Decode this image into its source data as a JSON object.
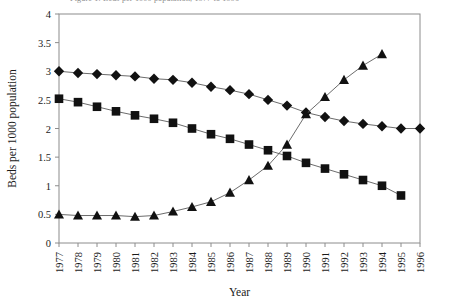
{
  "figure": {
    "truncated_caption": "Figure 1. Beds per 1000 population, 1977 to 1996",
    "xlabel": "Year",
    "ylabel": "Beds per 1000 population"
  },
  "chart_data": {
    "type": "line",
    "title": "",
    "xlabel": "Year",
    "ylabel": "Beds per 1000 population",
    "xlim": [
      1977,
      1996
    ],
    "ylim": [
      0,
      4
    ],
    "ytick_step": 0.5,
    "grid": false,
    "legend": "none",
    "x": [
      1977,
      1978,
      1979,
      1980,
      1981,
      1982,
      1983,
      1984,
      1985,
      1986,
      1987,
      1988,
      1989,
      1990,
      1991,
      1992,
      1993,
      1994,
      1995,
      1996
    ],
    "yticks": [
      0,
      0.5,
      1,
      1.5,
      2,
      2.5,
      3,
      3.5,
      4
    ],
    "xticks": [
      "1977",
      "1978",
      "1979",
      "1980",
      "1981",
      "1982",
      "1983",
      "1984",
      "1985",
      "1986",
      "1987",
      "1988",
      "1989",
      "1990",
      "1991",
      "1992",
      "1993",
      "1994",
      "1995",
      "1996"
    ],
    "series": [
      {
        "name": "Series 1",
        "marker": "diamond",
        "color": "#111111",
        "x": [
          1977,
          1978,
          1979,
          1980,
          1981,
          1982,
          1983,
          1984,
          1985,
          1986,
          1987,
          1988,
          1989,
          1990,
          1991,
          1992,
          1993,
          1994,
          1995,
          1996
        ],
        "values": [
          3.0,
          2.97,
          2.95,
          2.93,
          2.91,
          2.87,
          2.85,
          2.8,
          2.73,
          2.67,
          2.6,
          2.5,
          2.4,
          2.28,
          2.2,
          2.13,
          2.08,
          2.04,
          2.0,
          2.0
        ]
      },
      {
        "name": "Series 2",
        "marker": "square",
        "color": "#111111",
        "x": [
          1977,
          1978,
          1979,
          1980,
          1981,
          1982,
          1983,
          1984,
          1985,
          1986,
          1987,
          1988,
          1989,
          1990,
          1991,
          1992,
          1993,
          1994,
          1995
        ],
        "values": [
          2.52,
          2.46,
          2.38,
          2.3,
          2.23,
          2.17,
          2.1,
          2.0,
          1.9,
          1.82,
          1.72,
          1.62,
          1.52,
          1.4,
          1.3,
          1.2,
          1.1,
          1.0,
          0.83
        ]
      },
      {
        "name": "Series 3",
        "marker": "triangle",
        "color": "#111111",
        "x": [
          1977,
          1978,
          1979,
          1980,
          1981,
          1982,
          1983,
          1984,
          1985,
          1986,
          1987,
          1988,
          1989,
          1990,
          1991,
          1992,
          1993,
          1994
        ],
        "values": [
          0.5,
          0.48,
          0.48,
          0.48,
          0.46,
          0.48,
          0.55,
          0.63,
          0.72,
          0.88,
          1.1,
          1.35,
          1.72,
          2.25,
          2.55,
          2.85,
          3.1,
          3.3
        ]
      }
    ]
  }
}
